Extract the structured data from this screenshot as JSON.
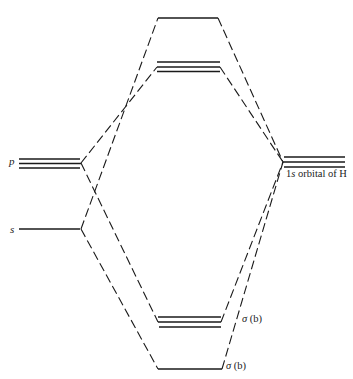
{
  "diagram": {
    "type": "molecular-orbital-energy-level-diagram",
    "left_atom_orbitals": [
      {
        "label": "p",
        "degeneracy": 3
      },
      {
        "label": "s",
        "degeneracy": 1
      }
    ],
    "right_group_orbitals": {
      "label_pre": "1",
      "label_italic": "s",
      "label_post": " orbital of H",
      "degeneracy": 3
    },
    "molecular_orbitals": [
      {
        "position": "top",
        "degeneracy": 1,
        "label": ""
      },
      {
        "position": "upper",
        "degeneracy": 3,
        "label": ""
      },
      {
        "position": "lower",
        "degeneracy": 3,
        "label": "σ (b)"
      },
      {
        "position": "bottom",
        "degeneracy": 1,
        "label": "σ (b)"
      }
    ]
  },
  "labels": {
    "p": "p",
    "s": "s",
    "h_pre": "1",
    "h_italic": "s",
    "h_post": " orbital of H",
    "sigma_b_upper_sym": "σ",
    "sigma_b_upper_paren": " (b)",
    "sigma_b_lower_sym": "σ",
    "sigma_b_lower_paren": " (b)"
  }
}
